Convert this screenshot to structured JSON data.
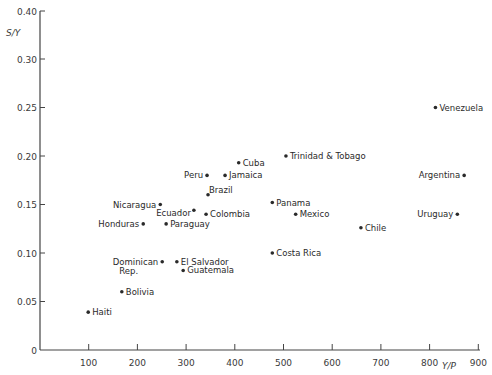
{
  "chart_data": {
    "type": "scatter",
    "title": "",
    "xlabel": "Y/P",
    "ylabel": "S/Y",
    "xlim": [
      0,
      900
    ],
    "ylim": [
      0,
      0.4
    ],
    "y_axis_break": "between 0.30 and 0.40",
    "grid": false,
    "legend": null,
    "x_ticks": [
      "100",
      "200",
      "300",
      "400",
      "500",
      "600",
      "700",
      "800",
      "900"
    ],
    "y_ticks": [
      "0",
      "0.05",
      "0.10",
      "0.15",
      "0.20",
      "0.25",
      "0.30",
      "0.40"
    ],
    "points": [
      {
        "label": "Venezuela",
        "x": 812,
        "y": 0.25,
        "label_side": "right"
      },
      {
        "label": "Trinidad & Tobago",
        "x": 505,
        "y": 0.2,
        "label_side": "right"
      },
      {
        "label": "Cuba",
        "x": 408,
        "y": 0.193,
        "label_side": "right"
      },
      {
        "label": "Peru",
        "x": 343,
        "y": 0.18,
        "label_side": "left"
      },
      {
        "label": "Jamaica",
        "x": 380,
        "y": 0.18,
        "label_side": "right"
      },
      {
        "label": "Argentina",
        "x": 871,
        "y": 0.18,
        "label_side": "left"
      },
      {
        "label": "Brazil",
        "x": 345,
        "y": 0.16,
        "label_side": "right-up"
      },
      {
        "label": "Nicaragua",
        "x": 247,
        "y": 0.15,
        "label_side": "left"
      },
      {
        "label": "Panama",
        "x": 477,
        "y": 0.152,
        "label_side": "right"
      },
      {
        "label": "Ecuador",
        "x": 316,
        "y": 0.144,
        "label_side": "left-down"
      },
      {
        "label": "Colombia",
        "x": 341,
        "y": 0.14,
        "label_side": "right"
      },
      {
        "label": "Mexico",
        "x": 525,
        "y": 0.14,
        "label_side": "right"
      },
      {
        "label": "Uruguay",
        "x": 857,
        "y": 0.14,
        "label_side": "left"
      },
      {
        "label": "Honduras",
        "x": 212,
        "y": 0.13,
        "label_side": "left"
      },
      {
        "label": "Paraguay",
        "x": 259,
        "y": 0.13,
        "label_side": "right"
      },
      {
        "label": "Chile",
        "x": 659,
        "y": 0.126,
        "label_side": "right"
      },
      {
        "label": "Costa Rica",
        "x": 477,
        "y": 0.1,
        "label_side": "right"
      },
      {
        "label": "Dominican Rep.",
        "x": 251,
        "y": 0.091,
        "label_side": "left"
      },
      {
        "label": "El Salvador",
        "x": 281,
        "y": 0.091,
        "label_side": "right"
      },
      {
        "label": "Guatemala",
        "x": 294,
        "y": 0.082,
        "label_side": "right"
      },
      {
        "label": "Bolivia",
        "x": 168,
        "y": 0.06,
        "label_side": "right"
      },
      {
        "label": "Haiti",
        "x": 99,
        "y": 0.039,
        "label_side": "right"
      }
    ]
  },
  "colors": {
    "ink": "#2a2a2a",
    "axis": "#444444",
    "background": "#ffffff"
  }
}
